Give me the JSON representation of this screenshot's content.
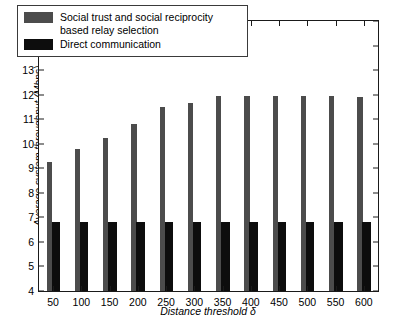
{
  "chart_data": {
    "type": "bar",
    "title": "",
    "xlabel": "Distance threshold δ",
    "ylabel": "Average system throughput (Mbps)",
    "categories": [
      "50",
      "100",
      "150",
      "200",
      "250",
      "300",
      "350",
      "400",
      "450",
      "500",
      "550",
      "600"
    ],
    "ylim": [
      4,
      15
    ],
    "yticks": [
      "4",
      "5",
      "6",
      "7",
      "8",
      "9",
      "10",
      "11",
      "12",
      "13",
      "14",
      "15"
    ],
    "grid": false,
    "legend_position": "top-left",
    "series": [
      {
        "name": "Social trust and social reciprocity based relay selection",
        "color": "#4c4c4c",
        "values": [
          9.25,
          9.8,
          10.25,
          10.8,
          11.5,
          11.65,
          11.95,
          11.95,
          11.95,
          11.95,
          11.95,
          11.9
        ]
      },
      {
        "name": "Direct communication",
        "color": "#0d0d0d",
        "values": [
          6.8,
          6.8,
          6.8,
          6.8,
          6.8,
          6.8,
          6.8,
          6.8,
          6.8,
          6.8,
          6.8,
          6.8
        ]
      }
    ]
  },
  "legend": {
    "items": [
      {
        "label_line1": "Social trust and social reciprocity",
        "label_line2": "based relay selection",
        "swatch": "gray"
      },
      {
        "label_line1": "Direct communication",
        "label_line2": "",
        "swatch": "black"
      }
    ]
  }
}
